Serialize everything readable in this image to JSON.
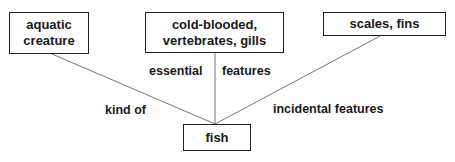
{
  "diagram": {
    "nodes": {
      "aquatic": {
        "label": "aquatic creature",
        "line1": "aquatic",
        "line2": "creature"
      },
      "essential": {
        "label": "cold-blooded, vertebrates, gills",
        "line1": "cold-blooded,",
        "line2": "vertebrates, gills"
      },
      "incidental": {
        "label": "scales, fins"
      },
      "fish": {
        "label": "fish"
      }
    },
    "edges": [
      {
        "from": "fish",
        "to": "aquatic",
        "label": "kind of"
      },
      {
        "from": "fish",
        "to": "essential",
        "label_left": "essential",
        "label_right": "features"
      },
      {
        "from": "fish",
        "to": "incidental",
        "label": "incidental features"
      }
    ],
    "colors": {
      "line": "#666666",
      "border": "#222222",
      "text": "#1a1a1a"
    }
  }
}
